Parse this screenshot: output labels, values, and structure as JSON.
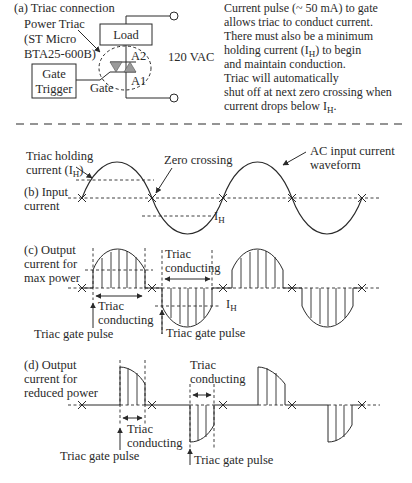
{
  "panel_a": {
    "title": "(a) Triac connection",
    "device_label_lines": [
      "Power Triac",
      "(ST Micro",
      "BTA25-600B)"
    ],
    "load_label": "Load",
    "gate_trigger_lines": [
      "Gate",
      "Trigger"
    ],
    "gate_label": "Gate",
    "a2_label": "A2",
    "a1_label": "A1",
    "supply_label": "120 VAC",
    "description_lines": [
      "Current pulse (~ 50 mA) to gate",
      "allows triac to conduct current.",
      "There must also be a minimum",
      "holding current (I",
      ") to begin",
      "and maintain conduction.",
      "Triac will automatically",
      "shut off at next zero crossing when",
      "current drops below I",
      "."
    ],
    "subscript_H": "H"
  },
  "panel_b": {
    "label_lines": [
      "(b) Input",
      "current"
    ],
    "holding_label": "Triac holding",
    "holding_label2": "current (I",
    "holding_label2_end": ")",
    "zero_crossing_label": "Zero crossing",
    "ac_label_lines": [
      "AC input current",
      "waveform"
    ],
    "ih_label": "I",
    "subscript_H": "H"
  },
  "panel_c": {
    "label_lines": [
      "(c) Output",
      "current for",
      "max power"
    ],
    "triac_conducting": [
      "Triac",
      "conducting"
    ],
    "gate_pulse": "Triac gate pulse",
    "ih_label": "I",
    "subscript_H": "H"
  },
  "panel_d": {
    "label_lines": [
      "(d) Output",
      "current for",
      "reduced power"
    ],
    "triac_conducting": [
      "Triac",
      "conducting"
    ],
    "gate_pulse": "Triac gate pulse"
  },
  "colors": {
    "ink": "#2a2a2a",
    "triac_fill": "#9a9a9a"
  }
}
